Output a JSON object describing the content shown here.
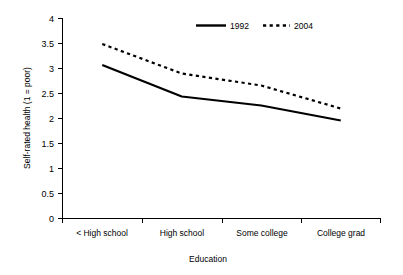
{
  "chart_data": {
    "type": "line",
    "title": "",
    "xlabel": "Education",
    "ylabel": "Self-rated health (1 = poor)",
    "categories": [
      "< High school",
      "High school",
      "Some college",
      "College grad"
    ],
    "series": [
      {
        "name": "1992",
        "style": "solid",
        "values": [
          3.07,
          2.44,
          2.26,
          1.96
        ]
      },
      {
        "name": "2004",
        "style": "dashed",
        "values": [
          3.49,
          2.9,
          2.66,
          2.2
        ]
      }
    ],
    "ylim": [
      0,
      4
    ],
    "ytick_labels": [
      "0",
      "0.5",
      "1",
      "1.5",
      "2",
      "2.5",
      "3",
      "3.5",
      "4"
    ],
    "ytick_values": [
      0,
      0.5,
      1,
      1.5,
      2,
      2.5,
      3,
      3.5,
      4
    ],
    "grid": false,
    "legend_position": "top-center",
    "line_color": "#000000",
    "background_color": "#ffffff"
  },
  "axis": {
    "y_title": "Self-rated health (1 = poor)",
    "x_title": "Education",
    "ticks": {
      "t0": "0",
      "t1": "0.5",
      "t2": "1",
      "t3": "1.5",
      "t4": "2",
      "t5": "2.5",
      "t6": "3",
      "t7": "3.5",
      "t8": "4"
    },
    "categories": {
      "c0": "< High school",
      "c1": "High school",
      "c2": "Some college",
      "c3": "College grad"
    }
  },
  "legend": {
    "entries": {
      "e0": "1992",
      "e1": "2004"
    }
  }
}
